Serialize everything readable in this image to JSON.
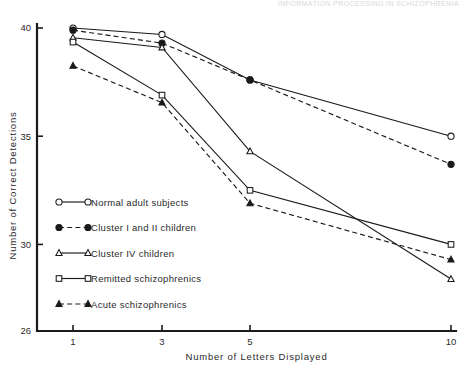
{
  "running_head": {
    "text": "INFORMATION PROCESSING IN SCHIZOPHRENIA"
  },
  "chart_data": {
    "type": "line",
    "title": "",
    "subtitle": "",
    "xlabel": "Number   of  Letters  Displayed",
    "ylabel": "Number   of   Correct   Detections",
    "x": [
      1,
      3,
      5,
      10
    ],
    "categories": [
      "1",
      "3",
      "5",
      "10"
    ],
    "xtick_labels": [
      "1",
      "3",
      "5",
      "10"
    ],
    "ytick_labels": [
      "26",
      "30",
      "35",
      "40"
    ],
    "yticks": [
      26,
      30,
      35,
      40
    ],
    "xlim": [
      1,
      10
    ],
    "ylim": [
      26,
      40
    ],
    "grid": false,
    "legend_position": "center-left-inside",
    "series": [
      {
        "name": "Normal adult subjects",
        "values": [
          40.0,
          39.7,
          37.6,
          35.0
        ],
        "marker": "open-circle",
        "linestyle": "solid"
      },
      {
        "name": "Cluster I and II children",
        "values": [
          39.9,
          39.3,
          37.6,
          33.7
        ],
        "marker": "filled-circle",
        "linestyle": "dashed"
      },
      {
        "name": "Cluster IV children",
        "values": [
          39.55,
          39.1,
          34.3,
          28.4
        ],
        "marker": "open-triangle",
        "linestyle": "solid"
      },
      {
        "name": "Remitted schizophrenics",
        "values": [
          39.35,
          36.9,
          32.5,
          30.0
        ],
        "marker": "open-square",
        "linestyle": "solid"
      },
      {
        "name": "Acute schizophrenics",
        "values": [
          38.25,
          36.55,
          31.9,
          29.3
        ],
        "marker": "filled-triangle",
        "linestyle": "dashed"
      }
    ]
  },
  "legend": {
    "entries": [
      {
        "label": "Normal adult subjects",
        "marker": "open-circle",
        "linestyle": "solid"
      },
      {
        "label": "Cluster I and II children",
        "marker": "filled-circle",
        "linestyle": "dashed"
      },
      {
        "label": "Cluster IV children",
        "marker": "open-triangle",
        "linestyle": "solid"
      },
      {
        "label": "Remitted schizophrenics",
        "marker": "open-square",
        "linestyle": "solid"
      },
      {
        "label": "Acute schizophrenics",
        "marker": "filled-triangle",
        "linestyle": "dashed"
      }
    ]
  },
  "colors": {
    "ink": "#1a1a1a",
    "background": "#ffffff",
    "running_head": "#d8d8d8"
  }
}
